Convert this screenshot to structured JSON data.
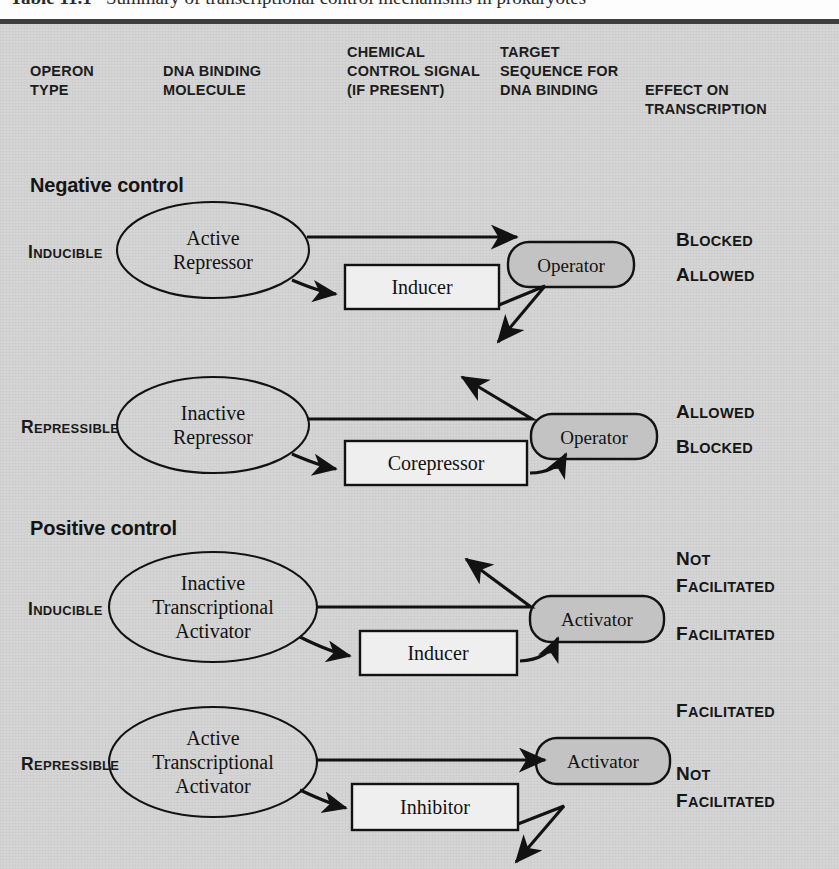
{
  "figure": {
    "title_number": "Table 11.1",
    "title_text": "Summary of transcriptional control mechanisms in prokaryotes"
  },
  "headers": [
    {
      "id": "operon-type",
      "label": "OPERON\nTYPE"
    },
    {
      "id": "dna-binding",
      "label": "DNA BINDING\nMOLECULE"
    },
    {
      "id": "chemical-signal",
      "label": "CHEMICAL\nCONTROL SIGNAL\n(IF PRESENT)"
    },
    {
      "id": "target-sequence",
      "label": "TARGET\nSEQUENCE FOR\nDNA BINDING"
    },
    {
      "id": "effect",
      "label": "EFFECT ON\nTRANSCRIPTION"
    }
  ],
  "sections": [
    {
      "id": "negative",
      "label": "Negative control"
    },
    {
      "id": "positive",
      "label": "Positive control"
    }
  ],
  "rows": [
    {
      "id": "negative-inducible",
      "section": "negative",
      "operon_type": "Inducible",
      "binding_molecule": "Active\nRepressor",
      "chemical_signal": "Inducer",
      "target": "Operator",
      "effect_without_signal": "Blocked",
      "effect_with_signal": "Allowed",
      "binds_without_signal": true,
      "binds_with_signal": false
    },
    {
      "id": "negative-repressible",
      "section": "negative",
      "operon_type": "Repressible",
      "binding_molecule": "Inactive\nRepressor",
      "chemical_signal": "Corepressor",
      "target": "Operator",
      "effect_without_signal": "Allowed",
      "effect_with_signal": "Blocked",
      "binds_without_signal": false,
      "binds_with_signal": true
    },
    {
      "id": "positive-inducible",
      "section": "positive",
      "operon_type": "Inducible",
      "binding_molecule": "Inactive\nTranscriptional\nActivator",
      "chemical_signal": "Inducer",
      "target": "Activator",
      "effect_without_signal": "Not\nFacilitated",
      "effect_with_signal": "Facilitated",
      "binds_without_signal": false,
      "binds_with_signal": true
    },
    {
      "id": "positive-repressible",
      "section": "positive",
      "operon_type": "Repressible",
      "binding_molecule": "Active\nTranscriptional\nActivator",
      "chemical_signal": "Inhibitor",
      "target": "Activator",
      "effect_without_signal": "Facilitated",
      "effect_with_signal": "Not\nFacilitated",
      "binds_without_signal": true,
      "binds_with_signal": false
    }
  ],
  "colors": {
    "page_background": "#ffffff",
    "table_background": "#d5d5d5",
    "rule": "#3d3d3d",
    "node_fill": "#c3c3c3",
    "box_fill": "#efefef",
    "ink": "#141414"
  }
}
